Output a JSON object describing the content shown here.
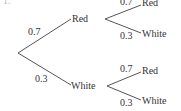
{
  "diagram": {
    "type": "probability-tree",
    "fragment": "1.",
    "first": [
      {
        "label": "Red",
        "prob": "0.7"
      },
      {
        "label": "White",
        "prob": "0.3"
      }
    ],
    "second_red": [
      {
        "label": "Red",
        "prob": "0.7"
      },
      {
        "label": "White",
        "prob": "0.3"
      }
    ],
    "second_white": [
      {
        "label": "Red",
        "prob": "0.7"
      },
      {
        "label": "White",
        "prob": "0.3"
      }
    ],
    "line_color": "#555555"
  }
}
